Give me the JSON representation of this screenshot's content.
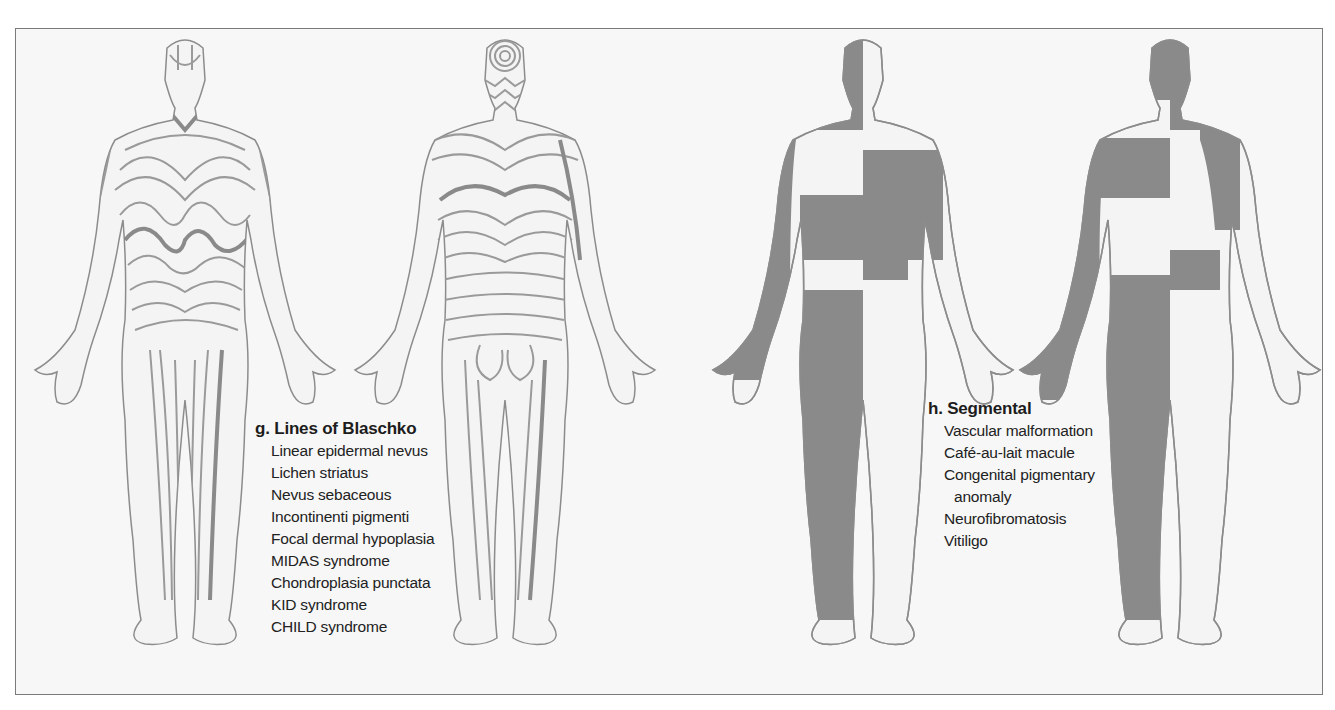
{
  "figure": {
    "colors": {
      "background": "#f7f7f7",
      "frame": "#7a7a7a",
      "outline": "#8c8c8c",
      "blaschko_line": "#9a9a9a",
      "blaschko_line_bold": "#8a8a8a",
      "segmental_fill": "#8a8a8a",
      "skin": "#f4f4f4",
      "text": "#1c1c1c"
    },
    "panels": [
      {
        "id": "g",
        "views": [
          "front",
          "back"
        ],
        "pattern": "lines-of-blaschko",
        "caption": {
          "title": "g. Lines of Blaschko",
          "items": [
            "Linear epidermal nevus",
            "Lichen striatus",
            "Nevus sebaceous",
            "Incontinenti pigmenti",
            "Focal dermal hypoplasia",
            "MIDAS syndrome",
            "Chondroplasia punctata",
            "KID syndrome",
            "CHILD syndrome"
          ]
        }
      },
      {
        "id": "h",
        "views": [
          "front",
          "back"
        ],
        "pattern": "segmental",
        "caption": {
          "title": "h. Segmental",
          "items": [
            "Vascular malformation",
            "Café-au-lait macule",
            "Congenital pigmentary",
            "anomaly",
            "Neurofibromatosis",
            "Vitiligo"
          ]
        }
      }
    ]
  }
}
